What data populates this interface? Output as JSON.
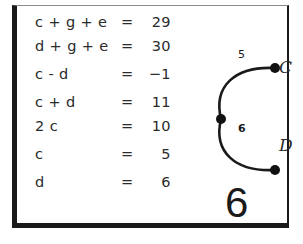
{
  "panel": {
    "background_color": "#ffffff",
    "border_color": "#1a1a1a"
  },
  "equations": {
    "rows": [
      {
        "lhs": "c + g + e",
        "eq": "=",
        "rhs": "29"
      },
      {
        "lhs": "d + g + e",
        "eq": "=",
        "rhs": "30"
      },
      {
        "lhs": "c - d",
        "eq": "=",
        "rhs": "−1"
      },
      {
        "lhs": "c + d",
        "eq": "=",
        "rhs": "11"
      },
      {
        "lhs": "2 c",
        "eq": "=",
        "rhs": "10"
      },
      {
        "lhs": "c",
        "eq": "=",
        "rhs": "5"
      },
      {
        "lhs": "d",
        "eq": "=",
        "rhs": "6"
      }
    ]
  },
  "graph": {
    "nodes": [
      {
        "id": "vertex",
        "label": ""
      },
      {
        "id": "C",
        "label": "C"
      },
      {
        "id": "D",
        "label": "D"
      }
    ],
    "edges": [
      {
        "from": "vertex",
        "to": "C",
        "weight": "5"
      },
      {
        "from": "vertex",
        "to": "D",
        "weight": "6"
      }
    ],
    "stroke_color": "#1a1a1a",
    "node_color": "#111111"
  },
  "page_number": "6"
}
